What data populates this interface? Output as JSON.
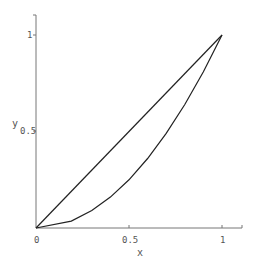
{
  "chart_data": {
    "type": "line",
    "title": "",
    "xlabel": "x",
    "ylabel": "y",
    "xlim": [
      0,
      1.1
    ],
    "ylim": [
      0,
      1.05
    ],
    "x_ticks": [
      "0",
      "0.5",
      "1"
    ],
    "y_ticks": [
      "0.5",
      "1"
    ],
    "grid": false,
    "legend": null,
    "series": [
      {
        "name": "y = x",
        "x": [
          0,
          1
        ],
        "y": [
          0,
          1
        ]
      },
      {
        "name": "y = x^2",
        "x": [
          0,
          0.19,
          0.3,
          0.4,
          0.5,
          0.6,
          0.7,
          0.8,
          0.9,
          1.0
        ],
        "y": [
          0,
          0.036,
          0.09,
          0.16,
          0.25,
          0.36,
          0.49,
          0.64,
          0.81,
          1.0
        ]
      }
    ]
  },
  "axes": {
    "x_label": "x",
    "y_label": "y",
    "x_tick_0": "0",
    "x_tick_05": "0.5",
    "x_tick_1": "1",
    "y_tick_05": "0.5",
    "y_tick_1": "1"
  },
  "colors": {
    "axis": "#777777",
    "line": "#222222"
  }
}
